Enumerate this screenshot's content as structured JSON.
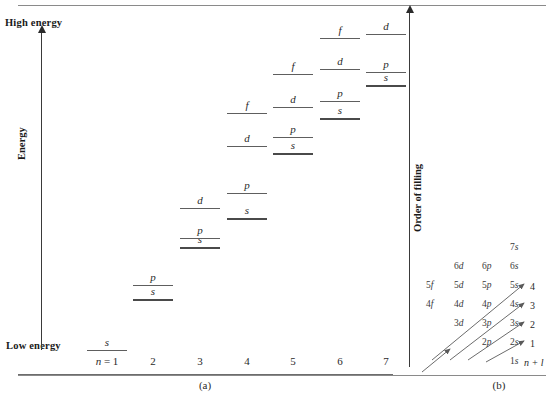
{
  "figure": {
    "caption_a": "(a)",
    "caption_b": "(b)"
  },
  "panel_a": {
    "axis_left": {
      "top_label": "High energy",
      "bottom_label": "Low energy",
      "name": "Energy"
    },
    "axis_right": {
      "name": "Order of filling"
    },
    "n_axis": {
      "first_label_prefix": "n =",
      "ticks": [
        "1",
        "2",
        "3",
        "4",
        "5",
        "6",
        "7"
      ]
    }
  },
  "chart_data": {
    "type": "scatter",
    "xlabel": "n",
    "ylabel": "Energy",
    "legend": [],
    "grid": false,
    "x": [
      1,
      2,
      3,
      4,
      5,
      6,
      7
    ],
    "xticklabels": [
      "n = 1",
      "2",
      "3",
      "4",
      "5",
      "6",
      "7"
    ],
    "ylim_labels": [
      "Low energy",
      "High energy"
    ],
    "levels": [
      {
        "n": 1,
        "l": "s",
        "x": 107,
        "y": 350,
        "emphasis": "normal"
      },
      {
        "n": 2,
        "l": "s",
        "x": 153,
        "y": 299,
        "emphasis": "thick"
      },
      {
        "n": 2,
        "l": "p",
        "x": 153,
        "y": 285,
        "emphasis": "normal"
      },
      {
        "n": 3,
        "l": "s",
        "x": 200,
        "y": 247,
        "emphasis": "thick"
      },
      {
        "n": 3,
        "l": "p",
        "x": 200,
        "y": 238,
        "emphasis": "normal"
      },
      {
        "n": 3,
        "l": "d",
        "x": 200,
        "y": 208,
        "emphasis": "normal"
      },
      {
        "n": 4,
        "l": "s",
        "x": 247,
        "y": 218,
        "emphasis": "thick"
      },
      {
        "n": 4,
        "l": "p",
        "x": 247,
        "y": 193,
        "emphasis": "normal"
      },
      {
        "n": 4,
        "l": "d",
        "x": 247,
        "y": 146,
        "emphasis": "normal"
      },
      {
        "n": 4,
        "l": "f",
        "x": 247,
        "y": 113,
        "emphasis": "normal"
      },
      {
        "n": 5,
        "l": "s",
        "x": 293,
        "y": 153,
        "emphasis": "thick"
      },
      {
        "n": 5,
        "l": "p",
        "x": 293,
        "y": 137,
        "emphasis": "normal"
      },
      {
        "n": 5,
        "l": "d",
        "x": 293,
        "y": 107,
        "emphasis": "normal"
      },
      {
        "n": 5,
        "l": "f",
        "x": 293,
        "y": 74,
        "emphasis": "normal"
      },
      {
        "n": 6,
        "l": "s",
        "x": 340,
        "y": 118,
        "emphasis": "thick"
      },
      {
        "n": 6,
        "l": "p",
        "x": 340,
        "y": 101,
        "emphasis": "normal"
      },
      {
        "n": 6,
        "l": "d",
        "x": 340,
        "y": 69,
        "emphasis": "normal"
      },
      {
        "n": 6,
        "l": "f",
        "x": 340,
        "y": 38,
        "emphasis": "normal"
      },
      {
        "n": 7,
        "l": "s",
        "x": 386,
        "y": 85,
        "emphasis": "thick"
      },
      {
        "n": 7,
        "l": "p",
        "x": 386,
        "y": 72,
        "emphasis": "normal"
      },
      {
        "n": 7,
        "l": "d",
        "x": 386,
        "y": 34,
        "emphasis": "normal"
      }
    ]
  },
  "panel_b": {
    "nl_label": "n + l",
    "rows": [
      {
        "y": 242,
        "orbitals": [
          {
            "n": "7",
            "l": "s",
            "x": 78
          }
        ]
      },
      {
        "y": 261,
        "orbitals": [
          {
            "n": "6",
            "l": "d",
            "x": 22
          },
          {
            "n": "6",
            "l": "p",
            "x": 50
          },
          {
            "n": "6",
            "l": "s",
            "x": 78
          }
        ]
      },
      {
        "y": 280,
        "orbitals": [
          {
            "n": "5",
            "l": "f",
            "x": -6
          },
          {
            "n": "5",
            "l": "d",
            "x": 22
          },
          {
            "n": "5",
            "l": "p",
            "x": 50
          },
          {
            "n": "5",
            "l": "s",
            "x": 78
          }
        ]
      },
      {
        "y": 299,
        "orbitals": [
          {
            "n": "4",
            "l": "f",
            "x": -6
          },
          {
            "n": "4",
            "l": "d",
            "x": 22
          },
          {
            "n": "4",
            "l": "p",
            "x": 50
          },
          {
            "n": "4",
            "l": "s",
            "x": 78
          }
        ]
      },
      {
        "y": 318,
        "orbitals": [
          {
            "n": "3",
            "l": "d",
            "x": 22
          },
          {
            "n": "3",
            "l": "p",
            "x": 50
          },
          {
            "n": "3",
            "l": "s",
            "x": 78
          }
        ]
      },
      {
        "y": 337,
        "orbitals": [
          {
            "n": "2",
            "l": "p",
            "x": 50
          },
          {
            "n": "2",
            "l": "s",
            "x": 78
          }
        ]
      },
      {
        "y": 356,
        "orbitals": [
          {
            "n": "1",
            "l": "s",
            "x": 78
          }
        ]
      }
    ],
    "sequence_numbers": [
      {
        "value": "4",
        "x": 110,
        "y": 281
      },
      {
        "value": "3",
        "x": 110,
        "y": 300
      },
      {
        "value": "2",
        "x": 110,
        "y": 319
      },
      {
        "value": "1",
        "x": 110,
        "y": 338
      }
    ],
    "arrows": [
      {
        "x1": 12,
        "y1": 360,
        "x2": 104,
        "y2": 284
      },
      {
        "x1": 30,
        "y1": 360,
        "x2": 104,
        "y2": 303
      },
      {
        "x1": 48,
        "y1": 360,
        "x2": 104,
        "y2": 322
      },
      {
        "x1": 66,
        "y1": 362,
        "x2": 104,
        "y2": 341
      },
      {
        "x1": 2,
        "y1": 372,
        "x2": 30,
        "y2": 349
      }
    ]
  },
  "colors": {
    "line": "#5e5e5e",
    "text": "#2a2a2a",
    "axis": "#3a3a3a",
    "rule": "#8a8a8a"
  }
}
